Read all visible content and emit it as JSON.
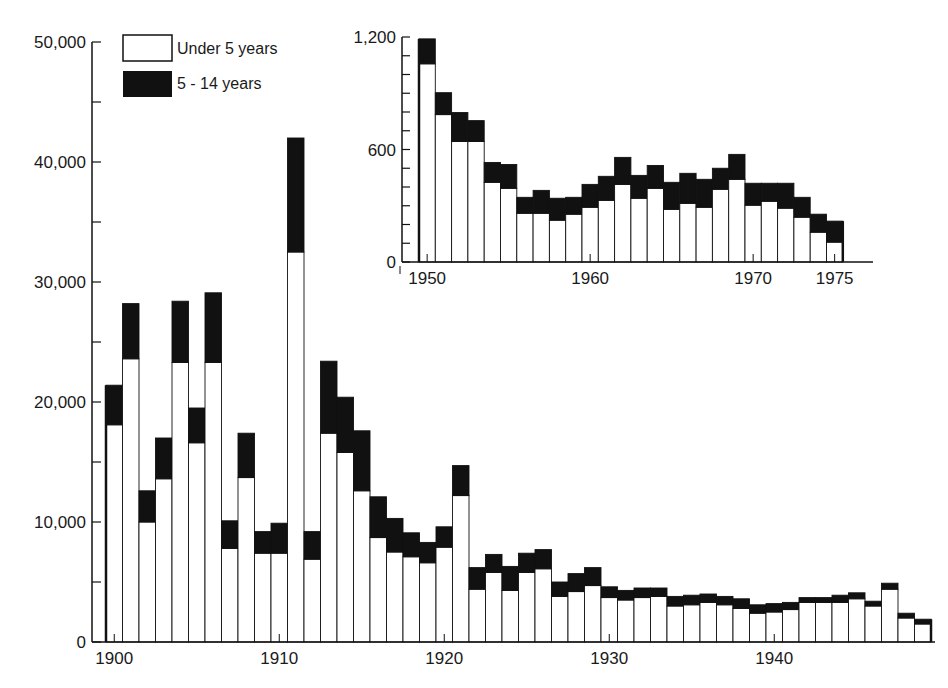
{
  "chart_data": [
    {
      "type": "bar",
      "stacked": true,
      "title": "",
      "xlabel": "",
      "ylabel": "",
      "categories": [
        1900,
        1901,
        1902,
        1903,
        1904,
        1905,
        1906,
        1907,
        1908,
        1909,
        1910,
        1911,
        1912,
        1913,
        1914,
        1915,
        1916,
        1917,
        1918,
        1919,
        1920,
        1921,
        1922,
        1923,
        1924,
        1925,
        1926,
        1927,
        1928,
        1929,
        1930,
        1931,
        1932,
        1933,
        1934,
        1935,
        1936,
        1937,
        1938,
        1939,
        1940,
        1941,
        1942,
        1943,
        1944,
        1945,
        1946,
        1947,
        1948,
        1949
      ],
      "series": [
        {
          "name": "Under 5 years",
          "color": "#ffffff",
          "values": [
            18100,
            23600,
            10000,
            13600,
            23300,
            16600,
            23300,
            7800,
            13700,
            7400,
            7400,
            32500,
            6900,
            17400,
            15800,
            12600,
            8700,
            7500,
            7100,
            6600,
            7900,
            12200,
            4400,
            5800,
            4300,
            5800,
            6100,
            3800,
            4200,
            4700,
            3700,
            3500,
            3700,
            3800,
            3000,
            3100,
            3300,
            3100,
            2800,
            2400,
            2500,
            2700,
            3300,
            3300,
            3300,
            3600,
            3000,
            4400,
            2000,
            1500
          ]
        },
        {
          "name": "5 - 14 years",
          "color": "#111111",
          "values": [
            3300,
            4600,
            2600,
            3400,
            5100,
            2900,
            5800,
            2300,
            3700,
            1800,
            2500,
            9500,
            2300,
            6000,
            4600,
            5000,
            3400,
            2800,
            2000,
            1700,
            1700,
            2500,
            1800,
            1500,
            2000,
            1600,
            1600,
            1200,
            1500,
            1500,
            900,
            800,
            800,
            700,
            800,
            800,
            700,
            700,
            800,
            700,
            700,
            600,
            400,
            400,
            600,
            500,
            400,
            500,
            400,
            400
          ]
        }
      ],
      "totals": [
        21400,
        28200,
        12600,
        17000,
        28400,
        19500,
        29100,
        10100,
        17400,
        9200,
        9900,
        42000,
        9200,
        23400,
        20400,
        17600,
        12100,
        10300,
        9100,
        8300,
        9600,
        14700,
        6200,
        7300,
        6300,
        7400,
        7700,
        5000,
        5700,
        6200,
        4600,
        4300,
        4500,
        4500,
        3800,
        3900,
        4000,
        3800,
        3600,
        3100,
        3200,
        3300,
        3700,
        3700,
        3900,
        4100,
        3400,
        4900,
        2400,
        1900
      ],
      "ylim": [
        0,
        50000
      ],
      "yticks": [
        0,
        10000,
        20000,
        30000,
        40000,
        50000
      ],
      "ytick_labels": [
        "0",
        "10,000",
        "20,000",
        "30,000",
        "40,000",
        "50,000"
      ],
      "xtick_labels": [
        "1900",
        "1910",
        "1920",
        "1930",
        "1940"
      ],
      "grid": false,
      "legend": {
        "position": "upper left",
        "entries": [
          "Under 5 years",
          "5 - 14 years"
        ]
      }
    },
    {
      "type": "bar",
      "stacked": true,
      "inset": true,
      "title": "",
      "categories": [
        1950,
        1951,
        1952,
        1953,
        1954,
        1955,
        1956,
        1957,
        1958,
        1959,
        1960,
        1961,
        1962,
        1963,
        1964,
        1965,
        1966,
        1967,
        1968,
        1969,
        1970,
        1971,
        1972,
        1973,
        1974,
        1975
      ],
      "series": [
        {
          "name": "Under 5 years",
          "color": "#ffffff",
          "values": [
            1057,
            786,
            643,
            643,
            425,
            393,
            260,
            260,
            223,
            255,
            292,
            329,
            414,
            340,
            393,
            281,
            313,
            292,
            388,
            441,
            303,
            324,
            287,
            239,
            159,
            106
          ]
        },
        {
          "name": "5 - 14 years",
          "color": "#111111",
          "values": [
            133,
            117,
            154,
            111,
            106,
            127,
            85,
            122,
            117,
            90,
            122,
            128,
            144,
            122,
            122,
            144,
            160,
            149,
            112,
            133,
            117,
            96,
            133,
            106,
            96,
            112
          ]
        }
      ],
      "totals": [
        1190,
        903,
        797,
        754,
        531,
        520,
        345,
        382,
        340,
        345,
        414,
        457,
        558,
        462,
        515,
        425,
        473,
        441,
        500,
        574,
        420,
        420,
        420,
        345,
        255,
        218
      ],
      "ylim": [
        0,
        1200
      ],
      "yticks": [
        0,
        600,
        1200
      ],
      "ytick_labels": [
        "0",
        "600",
        "1,200"
      ],
      "xtick_labels": [
        "1950",
        "1960",
        "1970",
        "1975"
      ],
      "grid": false
    }
  ],
  "legend": {
    "items": [
      {
        "label": "Under 5 years",
        "swatch": "#ffffff"
      },
      {
        "label": "5 - 14 years",
        "swatch": "#111111"
      }
    ]
  },
  "colors": {
    "ink": "#111111",
    "paper": "#ffffff",
    "text": "#1a1a1a"
  }
}
